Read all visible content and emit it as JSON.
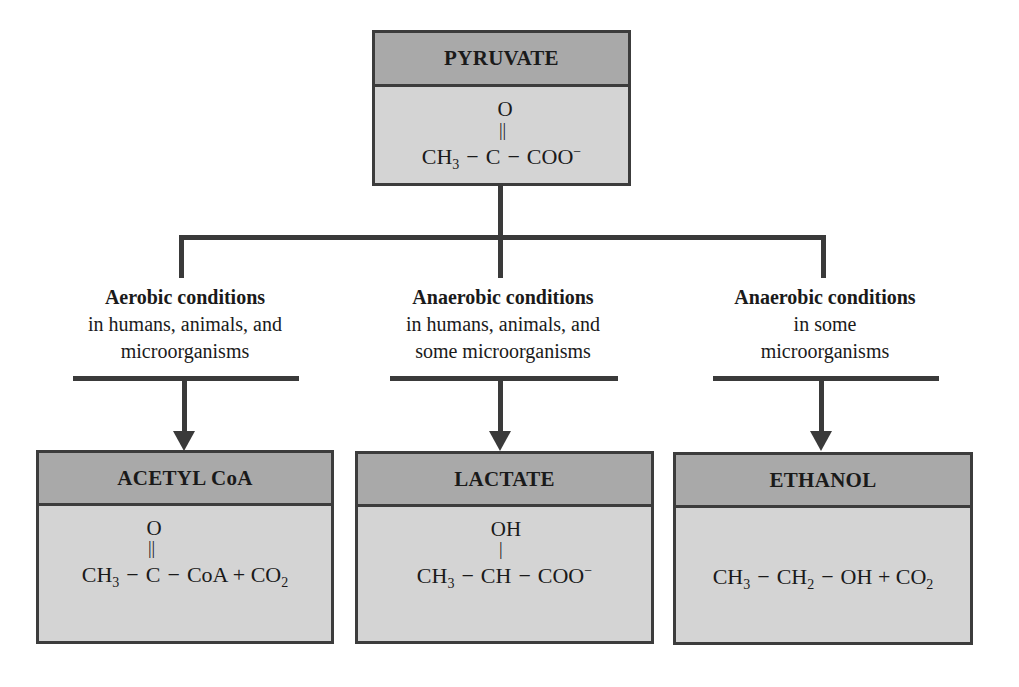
{
  "diagram": {
    "root": {
      "title": "PYRUVATE",
      "formula": {
        "above_atom": "O",
        "bond": "||",
        "parts": [
          "CH",
          "3",
          "C",
          "COO",
          "−"
        ]
      }
    },
    "branches": [
      {
        "condition_title": "Aerobic conditions",
        "condition_line1": "in humans, animals, and",
        "condition_line2": "microorganisms",
        "product": {
          "title": "ACETYL CoA",
          "formula": {
            "above_atom": "O",
            "bond": "||",
            "parts": [
              "CH",
              "3",
              "C",
              "CoA + CO",
              "2"
            ]
          }
        }
      },
      {
        "condition_title": "Anaerobic conditions",
        "condition_line1": "in humans, animals, and",
        "condition_line2": "some microorganisms",
        "product": {
          "title": "LACTATE",
          "formula": {
            "above_atom": "OH",
            "bond": "|",
            "parts": [
              "CH",
              "3",
              "CH",
              "COO",
              "−"
            ]
          }
        }
      },
      {
        "condition_title": "Anaerobic conditions",
        "condition_line1": "in some",
        "condition_line2": "microorganisms",
        "product": {
          "title": "ETHANOL",
          "formula": {
            "parts": [
              "CH",
              "3",
              "CH",
              "2",
              "OH + CO",
              "2"
            ]
          }
        }
      }
    ],
    "dash": "−",
    "colors": {
      "header_fill": "#a9a9a9",
      "body_fill": "#d4d4d4",
      "line": "#3a3a3a"
    }
  }
}
